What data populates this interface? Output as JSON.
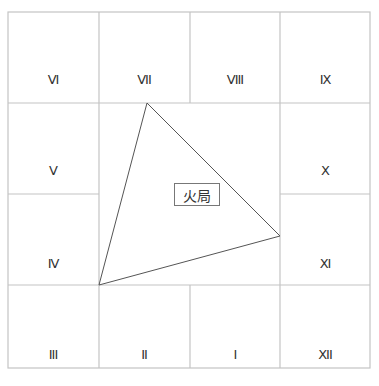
{
  "diagram": {
    "title_label": "火局",
    "cells": [
      {
        "id": "VI",
        "label": "VI",
        "x": 53,
        "y": 162
      },
      {
        "id": "VII",
        "label": "VII",
        "x": 144,
        "y": 162
      },
      {
        "id": "VIII",
        "label": "VIII",
        "x": 235,
        "y": 162
      },
      {
        "id": "IX",
        "label": "IX",
        "x": 325,
        "y": 162
      },
      {
        "id": "V",
        "label": "V",
        "x": 53,
        "y": 171
      },
      {
        "id": "X",
        "label": "X",
        "x": 325,
        "y": 171
      },
      {
        "id": "IV",
        "label": "IV",
        "x": 53,
        "y": 264
      },
      {
        "id": "XI",
        "label": "XI",
        "x": 325,
        "y": 264
      },
      {
        "id": "III",
        "label": "III",
        "x": 53,
        "y": 355
      },
      {
        "id": "II",
        "label": "II",
        "x": 144,
        "y": 355
      },
      {
        "id": "I",
        "label": "I",
        "x": 235,
        "y": 355
      },
      {
        "id": "XII",
        "label": "XII",
        "x": 325,
        "y": 355
      }
    ],
    "triangle": {
      "vertices": [
        [
          147,
          103
        ],
        [
          280,
          236
        ],
        [
          99,
          285
        ]
      ],
      "connects": [
        "VII",
        "XI",
        "III"
      ]
    },
    "colors": {
      "grid": "#c4c4c4",
      "triangle": "#555555",
      "text": "#333333"
    }
  }
}
